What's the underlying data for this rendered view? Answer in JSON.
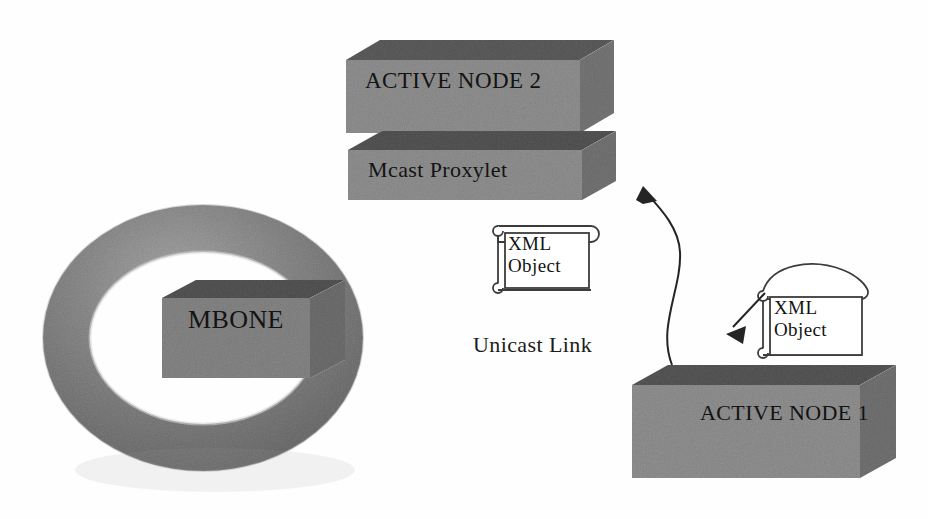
{
  "diagram": {
    "background_color": "#ffffff",
    "nodes": {
      "active_node_2": {
        "label": "ACTIVE NODE 2",
        "shape": "3d-box",
        "fill_color": "#b9b9b9",
        "top_color": "#9a9a9a",
        "side_color": "#a8a8a8"
      },
      "mcast_proxylet": {
        "label": "Mcast Proxylet",
        "shape": "3d-box",
        "fill_color": "#b9b9b9",
        "top_color": "#8f8f8f",
        "side_color": "#a6a6a6"
      },
      "mbone_ring": {
        "label": "",
        "shape": "torus",
        "fill_color": "#b0b0b0"
      },
      "mbone": {
        "label": "MBONE",
        "shape": "3d-box",
        "fill_color": "#b4b4b4",
        "top_color": "#8d8d8d",
        "side_color": "#a0a0a0"
      },
      "active_node_1": {
        "label": "ACTIVE NODE 1",
        "shape": "3d-box",
        "fill_color": "#b9b9b9",
        "top_color": "#909090",
        "side_color": "#a4a4a4"
      },
      "xml_object_upper": {
        "label_line_1": "XML",
        "label_line_2": "Object",
        "shape": "scroll-document",
        "fill_color": "#ffffff",
        "stroke_color": "#3a3a3a"
      },
      "xml_object_lower": {
        "label_line_1": "XML",
        "label_line_2": "Object",
        "shape": "scroll-document",
        "fill_color": "#ffffff",
        "stroke_color": "#3a3a3a"
      }
    },
    "connectors": {
      "unicast_link": {
        "label": "Unicast Link",
        "style": "curved-arrow",
        "stroke_color": "#2a2a2a",
        "from": "active-node-1",
        "to": "mcast-proxylet"
      },
      "xml_emit_arrow": {
        "label": "",
        "style": "straight-arrow",
        "stroke_color": "#2a2a2a",
        "from": "xml-object-lower",
        "to": "active-node-1"
      }
    }
  }
}
